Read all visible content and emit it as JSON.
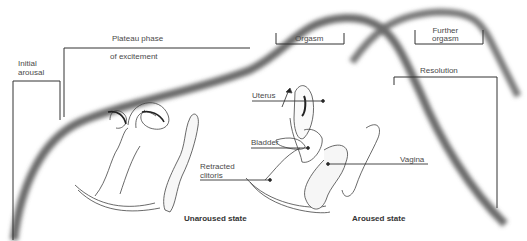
{
  "phases": {
    "initial_arousal": [
      "Initial",
      "arousal"
    ],
    "plateau": [
      "Plateau phase",
      "of excitement"
    ],
    "orgasm": "Orgasm",
    "further_orgasm": [
      "Further",
      "orgasm"
    ],
    "resolution": "Resolution"
  },
  "anatomy": {
    "uterus": "Uterus",
    "bladder": "Bladder",
    "retracted_clitoris": [
      "Retracted",
      "clitoris"
    ],
    "vagina": "Vagina"
  },
  "states": {
    "unaroused": "Unaroused state",
    "aroused": "Aroused state"
  },
  "colors": {
    "curve": "#6a6a6a",
    "line": "#333333",
    "background": "#ffffff"
  }
}
